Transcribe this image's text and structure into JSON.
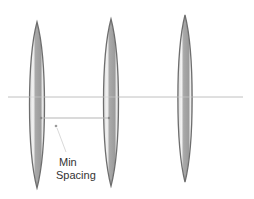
{
  "diagram": {
    "elements": [
      {
        "id": "lens-1",
        "cx": 37,
        "top": 22,
        "bottom": 188,
        "width": 18
      },
      {
        "id": "lens-2",
        "cx": 111,
        "top": 19,
        "bottom": 186,
        "width": 18
      },
      {
        "id": "lens-3",
        "cx": 185,
        "top": 15,
        "bottom": 182,
        "width": 17
      }
    ],
    "axis_line": {
      "y": 97,
      "x1": 8,
      "x2": 243
    },
    "spacing_line": {
      "y": 118,
      "x1": 40,
      "x2": 110
    },
    "annotation": {
      "label_line1": "Min",
      "label_line2": "Spacing"
    },
    "colors": {
      "lens_outline": "#6e6e6e",
      "lens_fill": "#a8a8a8",
      "lens_highlight": "#f2f2f2",
      "axis_line": "#c8c8c8",
      "spacing_line": "#b0b0b0",
      "text": "#333333"
    }
  }
}
